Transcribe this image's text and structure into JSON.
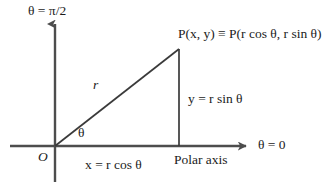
{
  "figure": {
    "background_color": "#ffffff",
    "stroke_color": "#4d4d4d",
    "text_color": "#1b1b1b"
  },
  "labels": {
    "theta_pi_over_two": "θ = π/2",
    "point_p": "P(x, y) ≡ P(r cos θ, r sin θ)",
    "radius": "r",
    "theta_angle": "θ",
    "y_expression": "y = r sin θ",
    "origin": "O",
    "x_expression": "x = r cos θ",
    "polar_axis": "Polar axis",
    "theta_zero": "θ = 0"
  },
  "geometry": {
    "origin": {
      "x": 55,
      "y": 146
    },
    "point_p": {
      "x": 179,
      "y": 49
    },
    "vertical_axis": {
      "x": 55,
      "y_top": 20,
      "y_bottom": 182
    },
    "horizontal_axis": {
      "y": 146,
      "x_left": 10,
      "x_right": 250
    },
    "foot_of_perpendicular": {
      "x": 179,
      "y": 146
    }
  }
}
